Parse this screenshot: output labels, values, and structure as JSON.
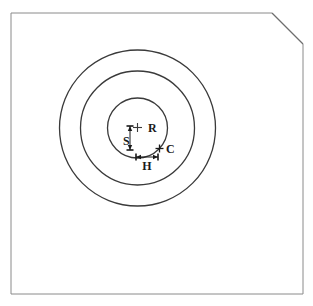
{
  "figure": {
    "background_color": "#ffffff",
    "frame": {
      "name": "outer-frame",
      "x": 11,
      "y": 13,
      "width": 292,
      "height": 281,
      "stroke_color": "#8a8a8a",
      "stroke_width": 1,
      "clipped_corner": "top-right",
      "corner_cut": {
        "start_x": 272,
        "start_y": 13,
        "end_x": 303,
        "end_y": 44,
        "stroke_color": "#6e6e6e",
        "stroke_width": 1.2
      }
    },
    "center": {
      "x": 137.5,
      "y": 128
    },
    "circles": [
      {
        "name": "outer-circle",
        "radius": 78,
        "stroke_color": "#3a3a3a",
        "stroke_width": 1.3
      },
      {
        "name": "middle-circle",
        "radius": 57,
        "stroke_color": "#3a3a3a",
        "stroke_width": 1.3
      },
      {
        "name": "inner-circle",
        "radius": 30,
        "stroke_color": "#3a3a3a",
        "stroke_width": 1.3
      }
    ],
    "markers": [
      {
        "name": "center-cross-marker",
        "symbol": "plus-cross",
        "x": 137.5,
        "y": 127.5,
        "size": 9,
        "stroke_color": "#3a3a3a",
        "label": "R",
        "label_x": 148,
        "label_y": 132,
        "label_size": 12
      },
      {
        "name": "chord-point-cross-marker",
        "symbol": "plus-cross",
        "x": 159.5,
        "y": 148.5,
        "size": 8,
        "stroke_color": "#1a1a1a",
        "label": "C",
        "label_x": 166,
        "label_y": 153,
        "label_size": 12
      }
    ],
    "dimensions": [
      {
        "name": "vertical-dimension-s",
        "orientation": "vertical",
        "x": 130,
        "y1": 126,
        "y2": 150,
        "stroke_color": "#1a1a1a",
        "stroke_width": 1,
        "label": "S",
        "label_x": 123,
        "label_y": 145,
        "label_size": 12
      },
      {
        "name": "horizontal-dimension-h",
        "orientation": "horizontal",
        "y": 157,
        "x1": 136,
        "x2": 158,
        "stroke_color": "#1a1a1a",
        "stroke_width": 1,
        "label": "H",
        "label_x": 147,
        "label_y": 170,
        "label_size": 12
      }
    ]
  },
  "chart_data": {
    "type": "scatter",
    "title": "",
    "xlabel": "",
    "ylabel": "",
    "annotations": [
      "R",
      "S",
      "C",
      "H"
    ],
    "series": [
      {
        "name": "concentric-circle-radii",
        "center": [
          137.5,
          128
        ],
        "values": [
          30,
          57,
          78
        ]
      },
      {
        "name": "labelled-points",
        "points": [
          {
            "label": "R",
            "x": 137.5,
            "y": 127.5,
            "meaning": "circle centre / radius reference"
          },
          {
            "label": "C",
            "x": 159.5,
            "y": 148.5,
            "meaning": "point on inner circle"
          }
        ]
      },
      {
        "name": "labelled-dimensions",
        "points": [
          {
            "label": "S",
            "x": 130,
            "y": 138,
            "length": 24,
            "orientation": "vertical"
          },
          {
            "label": "H",
            "x": 147,
            "y": 157,
            "length": 22,
            "orientation": "horizontal"
          }
        ]
      }
    ],
    "grid": false,
    "legend": "none"
  }
}
